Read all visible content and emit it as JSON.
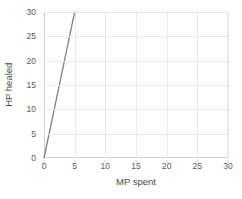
{
  "chart_data": {
    "type": "line",
    "title": "",
    "xlabel": "MP spent",
    "ylabel": "HP healed",
    "xlim": [
      0,
      30
    ],
    "ylim": [
      0,
      30
    ],
    "xticks": [
      0,
      5,
      10,
      15,
      20,
      25,
      30
    ],
    "yticks": [
      0,
      5,
      10,
      15,
      20,
      25,
      30
    ],
    "xtick_labels": [
      "0",
      "5",
      "10",
      "15",
      "20",
      "25",
      "30"
    ],
    "ytick_labels": [
      "0",
      "5",
      "10",
      "15",
      "20",
      "25",
      "30"
    ],
    "grid": true,
    "legend": false,
    "series": [
      {
        "name": "HP healed",
        "color": "#808080",
        "x": [
          0,
          5
        ],
        "values": [
          0,
          30
        ],
        "slope": 6,
        "points": [
          {
            "x": 0,
            "y": 0
          },
          {
            "x": 1,
            "y": 6
          },
          {
            "x": 2,
            "y": 12
          },
          {
            "x": 3,
            "y": 18
          },
          {
            "x": 4,
            "y": 24
          },
          {
            "x": 5,
            "y": 30
          }
        ]
      }
    ]
  },
  "style": {
    "line_color": "#808080",
    "grid_color": "#e9e9e9",
    "axis_color": "#d0d0d0",
    "tick_text_color": "#5a5a5a",
    "label_text_color": "#4a4a4a",
    "background": "#ffffff"
  }
}
